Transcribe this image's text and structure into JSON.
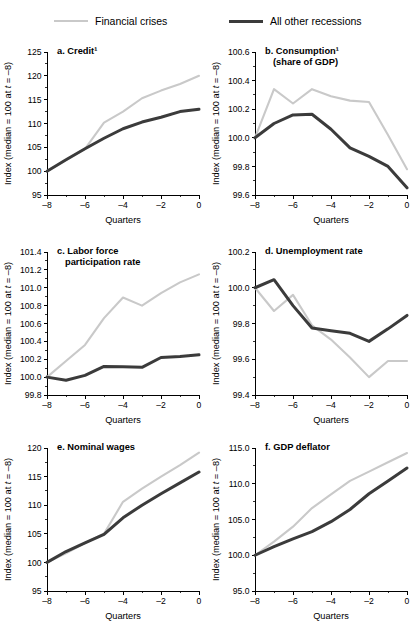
{
  "legend": {
    "items": [
      {
        "label": "Financial crises",
        "color": "#c9c9c9",
        "key": "crises"
      },
      {
        "label": "All other recessions",
        "color": "#3b3b3b",
        "key": "other"
      }
    ]
  },
  "axis": {
    "y_title": "Index (median = 100 at t = –8)",
    "x_title": "Quarters"
  },
  "chart_data": [
    {
      "id": "a",
      "type": "line",
      "title": "a. Credit¹",
      "title_lines": [
        "a. Credit¹"
      ],
      "xlabel": "Quarters",
      "ylabel": "Index (median = 100 at t = –8)",
      "x": [
        -8,
        -7,
        -6,
        -5,
        -4,
        -3,
        -2,
        -1,
        0
      ],
      "xlim": [
        -8,
        0
      ],
      "ylim": [
        95,
        125
      ],
      "yticks": [
        95,
        100,
        105,
        110,
        115,
        120,
        125
      ],
      "ytick_labels": [
        "95",
        "100",
        "105",
        "110",
        "115",
        "120",
        "125"
      ],
      "xticks": [
        -8,
        -6,
        -4,
        -2,
        0
      ],
      "xtick_labels": [
        "–8",
        "–6",
        "–4",
        "–2",
        "0"
      ],
      "grid": false,
      "series": [
        {
          "name": "Financial crises",
          "color": "#c9c9c9",
          "values": [
            100.0,
            102.3,
            104.7,
            110.2,
            112.5,
            115.3,
            116.9,
            118.3,
            120.0
          ]
        },
        {
          "name": "All other recessions",
          "color": "#3b3b3b",
          "values": [
            100.0,
            102.4,
            104.7,
            106.9,
            108.9,
            110.3,
            111.3,
            112.5,
            113.0
          ]
        }
      ]
    },
    {
      "id": "b",
      "type": "line",
      "title": "b. Consumption¹ (share of GDP)",
      "title_lines": [
        "b. Consumption¹",
        "(share of GDP)"
      ],
      "xlabel": "Quarters",
      "ylabel": "Index (median = 100 at t = –8)",
      "x": [
        -8,
        -7,
        -6,
        -5,
        -4,
        -3,
        -2,
        -1,
        0
      ],
      "xlim": [
        -8,
        0
      ],
      "ylim": [
        99.6,
        100.6
      ],
      "yticks": [
        99.6,
        99.8,
        100.0,
        100.2,
        100.4,
        100.6
      ],
      "ytick_labels": [
        "99.6",
        "99.8",
        "100.0",
        "100.2",
        "100.4",
        "100.6"
      ],
      "xticks": [
        -8,
        -6,
        -4,
        -2,
        0
      ],
      "xtick_labels": [
        "–8",
        "–6",
        "–4",
        "–2",
        "0"
      ],
      "grid": false,
      "series": [
        {
          "name": "Financial crises",
          "color": "#c9c9c9",
          "values": [
            100.0,
            100.34,
            100.24,
            100.34,
            100.29,
            100.26,
            100.25,
            100.02,
            99.78
          ]
        },
        {
          "name": "All other recessions",
          "color": "#3b3b3b",
          "values": [
            100.0,
            100.1,
            100.16,
            100.165,
            100.06,
            99.93,
            99.87,
            99.8,
            99.65
          ]
        }
      ]
    },
    {
      "id": "c",
      "type": "line",
      "title": "c. Labor force participation rate",
      "title_lines": [
        "c. Labor force",
        "participation rate"
      ],
      "xlabel": "Quarters",
      "ylabel": "Index (median = 100 at t = –8)",
      "x": [
        -8,
        -7,
        -6,
        -5,
        -4,
        -3,
        -2,
        -1,
        0
      ],
      "xlim": [
        -8,
        0
      ],
      "ylim": [
        99.8,
        101.4
      ],
      "yticks": [
        99.8,
        100.0,
        100.2,
        100.4,
        100.6,
        100.8,
        101.0,
        101.2,
        101.4
      ],
      "ytick_labels": [
        "99.8",
        "100.0",
        "100.2",
        "100.4",
        "100.6",
        "100.8",
        "101.0",
        "101.2",
        "101.4"
      ],
      "xticks": [
        -8,
        -6,
        -4,
        -2,
        0
      ],
      "xtick_labels": [
        "–8",
        "–6",
        "–4",
        "–2",
        "0"
      ],
      "grid": false,
      "series": [
        {
          "name": "Financial crises",
          "color": "#c9c9c9",
          "values": [
            100.0,
            100.18,
            100.36,
            100.66,
            100.89,
            100.8,
            100.94,
            101.06,
            101.15
          ]
        },
        {
          "name": "All other recessions",
          "color": "#3b3b3b",
          "values": [
            100.0,
            99.965,
            100.02,
            100.12,
            100.115,
            100.11,
            100.22,
            100.23,
            100.25
          ]
        }
      ]
    },
    {
      "id": "d",
      "type": "line",
      "title": "d. Unemployment rate",
      "title_lines": [
        "d. Unemployment rate"
      ],
      "xlabel": "Quarters",
      "ylabel": "Index (median = 100 at t = –8)",
      "x": [
        -8,
        -7,
        -6,
        -5,
        -4,
        -3,
        -2,
        -1,
        0
      ],
      "xlim": [
        -8,
        0
      ],
      "ylim": [
        99.4,
        100.2
      ],
      "yticks": [
        99.4,
        99.6,
        99.8,
        100.0,
        100.2
      ],
      "ytick_labels": [
        "99.4",
        "99.6",
        "99.8",
        "100.0",
        "100.2"
      ],
      "xticks": [
        -8,
        -6,
        -4,
        -2,
        0
      ],
      "xtick_labels": [
        "–8",
        "–6",
        "–4",
        "–2",
        "0"
      ],
      "grid": false,
      "series": [
        {
          "name": "Financial crises",
          "color": "#c9c9c9",
          "values": [
            100.0,
            99.87,
            99.96,
            99.79,
            99.71,
            99.61,
            99.5,
            99.59,
            99.59
          ]
        },
        {
          "name": "All other recessions",
          "color": "#3b3b3b",
          "values": [
            100.0,
            100.045,
            99.9,
            99.775,
            99.76,
            99.745,
            99.7,
            99.77,
            99.845
          ]
        }
      ]
    },
    {
      "id": "e",
      "type": "line",
      "title": "e. Nominal wages",
      "title_lines": [
        "e. Nominal wages"
      ],
      "xlabel": "Quarters",
      "ylabel": "Index (median = 100 at t = –8)",
      "x": [
        -8,
        -7,
        -6,
        -5,
        -4,
        -3,
        -2,
        -1,
        0
      ],
      "xlim": [
        -8,
        0
      ],
      "ylim": [
        95,
        120
      ],
      "yticks": [
        95,
        100,
        105,
        110,
        115,
        120
      ],
      "ytick_labels": [
        "95",
        "100",
        "105",
        "110",
        "115",
        "120"
      ],
      "xticks": [
        -8,
        -6,
        -4,
        -2,
        0
      ],
      "xtick_labels": [
        "–8",
        "–6",
        "–4",
        "–2",
        "0"
      ],
      "grid": false,
      "series": [
        {
          "name": "Financial crises",
          "color": "#c9c9c9",
          "values": [
            100.0,
            101.6,
            103.4,
            105.0,
            110.6,
            112.9,
            115.0,
            117.0,
            119.2
          ]
        },
        {
          "name": "All other recessions",
          "color": "#3b3b3b",
          "values": [
            100.0,
            101.9,
            103.4,
            104.9,
            107.8,
            110.0,
            112.0,
            113.9,
            115.8
          ]
        }
      ]
    },
    {
      "id": "f",
      "type": "line",
      "title": "f. GDP deflator",
      "title_lines": [
        "f. GDP deflator"
      ],
      "xlabel": "Quarters",
      "ylabel": "Index (median = 100 at t = –8)",
      "x": [
        -8,
        -7,
        -6,
        -5,
        -4,
        -3,
        -2,
        -1,
        0
      ],
      "xlim": [
        -8,
        0
      ],
      "ylim": [
        95.0,
        115.0
      ],
      "yticks": [
        95.0,
        100.0,
        105.0,
        110.0,
        115.0
      ],
      "ytick_labels": [
        "95.0",
        "100.0",
        "105.0",
        "110.0",
        "115.0"
      ],
      "xticks": [
        -8,
        -6,
        -4,
        -2,
        0
      ],
      "xtick_labels": [
        "–8",
        "–6",
        "–4",
        "–2",
        "0"
      ],
      "grid": false,
      "series": [
        {
          "name": "Financial crises",
          "color": "#c9c9c9",
          "values": [
            100.0,
            101.9,
            104.0,
            106.6,
            108.5,
            110.4,
            111.7,
            113.0,
            114.3
          ]
        },
        {
          "name": "All other recessions",
          "color": "#3b3b3b",
          "values": [
            100.0,
            101.2,
            102.3,
            103.3,
            104.7,
            106.4,
            108.6,
            110.4,
            112.2
          ]
        }
      ]
    }
  ]
}
